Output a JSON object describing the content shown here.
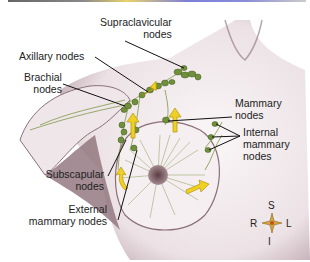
{
  "figure": {
    "labels": {
      "supraclavicular_1": "Supraclavicular",
      "supraclavicular_2": "nodes",
      "axillary": "Axillary nodes",
      "brachial_1": "Brachial",
      "brachial_2": "nodes",
      "mammary_1": "Mammary",
      "mammary_2": "nodes",
      "internal_1": "Internal",
      "internal_2": "mammary",
      "internal_3": "nodes",
      "subscapular_1": "Subscapular",
      "subscapular_2": "nodes",
      "external_1": "External",
      "external_2": "mammary nodes"
    },
    "compass": {
      "top": "S",
      "bottom": "I",
      "left": "R",
      "right": "L"
    },
    "colors": {
      "node": "#6f8f3a",
      "arrow": "#f0d020",
      "skin": "#f3ecee",
      "shadow": "#7a5d66",
      "leader": "#111111"
    }
  }
}
